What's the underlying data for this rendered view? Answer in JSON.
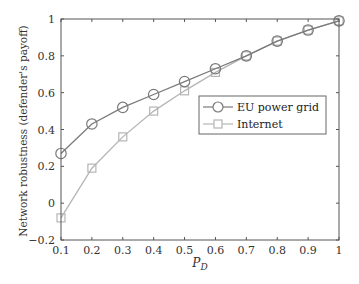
{
  "chart_data": {
    "type": "line",
    "title": "",
    "xlabel": "P_D",
    "xlabel_main": "P",
    "xlabel_sub": "D",
    "ylabel": "Network robustness (defender's payoff)",
    "x": [
      0.1,
      0.2,
      0.3,
      0.4,
      0.5,
      0.6,
      0.7,
      0.8,
      0.9,
      1.0
    ],
    "xlim": [
      0.1,
      1.0
    ],
    "ylim": [
      -0.2,
      1.0
    ],
    "xticks": [
      "0.1",
      "0.2",
      "0.3",
      "0.4",
      "0.5",
      "0.6",
      "0.7",
      "0.8",
      "0.9",
      "1"
    ],
    "yticks": [
      -0.2,
      0,
      0.2,
      0.4,
      0.6,
      0.8,
      1
    ],
    "ytick_labels": [
      "−0.2",
      "0",
      "0.2",
      "0.4",
      "0.6",
      "0.8",
      "1"
    ],
    "grid": false,
    "legend_position": "center-right",
    "series": [
      {
        "name": "EU power grid",
        "marker": "circle",
        "color": "#7a7a7a",
        "values": [
          0.27,
          0.43,
          0.52,
          0.59,
          0.66,
          0.73,
          0.8,
          0.88,
          0.94,
          0.99
        ]
      },
      {
        "name": "Internet",
        "marker": "square",
        "color": "#b5b5b5",
        "values": [
          -0.08,
          0.19,
          0.36,
          0.5,
          0.61,
          0.71,
          0.8,
          0.88,
          0.94,
          0.99
        ]
      }
    ]
  }
}
